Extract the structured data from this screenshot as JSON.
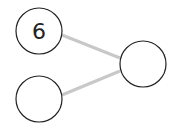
{
  "nodes": [
    {
      "id": "top-left",
      "label": "6",
      "cx": 39,
      "cy": 31,
      "r": 23
    },
    {
      "id": "bottom-left",
      "label": "",
      "cx": 39,
      "cy": 99,
      "r": 23
    },
    {
      "id": "right",
      "label": "",
      "cx": 143,
      "cy": 64,
      "r": 23
    }
  ],
  "edges": [
    {
      "from": "top-left",
      "to": "right"
    },
    {
      "from": "bottom-left",
      "to": "right"
    }
  ],
  "colors": {
    "edge": "#c8c8c8",
    "node_stroke": "#222222",
    "text": "#222222"
  }
}
